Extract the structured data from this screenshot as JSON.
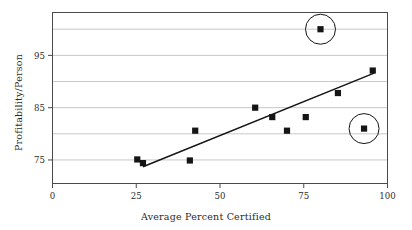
{
  "chart_data": {
    "type": "scatter",
    "title": "",
    "xlabel": "Average Percent Certified",
    "ylabel": "Profitability/Person",
    "xlim": [
      0,
      100
    ],
    "ylim": [
      70.5,
      103.2
    ],
    "grid": true,
    "legend": "none",
    "xticks": [
      0,
      25,
      50,
      75,
      100
    ],
    "xtick_labels": [
      "0",
      "25",
      "50",
      "75",
      "100"
    ],
    "yticks": [
      75,
      85,
      95
    ],
    "ytick_labels": [
      "75",
      "85",
      "95"
    ],
    "ygridlines": [
      75,
      80,
      85,
      90,
      95,
      100
    ],
    "points": [
      {
        "x": 25.3,
        "y": 75.1,
        "circled": false
      },
      {
        "x": 27.0,
        "y": 74.4,
        "circled": false
      },
      {
        "x": 41.0,
        "y": 74.9,
        "circled": false
      },
      {
        "x": 42.6,
        "y": 80.6,
        "circled": false
      },
      {
        "x": 60.5,
        "y": 85.0,
        "circled": false
      },
      {
        "x": 65.6,
        "y": 83.2,
        "circled": false
      },
      {
        "x": 70.0,
        "y": 80.6,
        "circled": false
      },
      {
        "x": 75.6,
        "y": 83.2,
        "circled": false
      },
      {
        "x": 80.0,
        "y": 100.0,
        "circled": true
      },
      {
        "x": 85.2,
        "y": 87.8,
        "circled": false
      },
      {
        "x": 93.0,
        "y": 81.0,
        "circled": true
      },
      {
        "x": 95.6,
        "y": 92.1,
        "circled": false
      }
    ],
    "trendline": {
      "label": "linear-fit",
      "x0": 27.0,
      "y0": 73.7,
      "x1": 96.0,
      "y1": 91.6
    },
    "annotations": [
      {
        "name": "outlier-circle-high",
        "x": 80.0,
        "y": 100.0,
        "radius_px": 15
      },
      {
        "name": "outlier-circle-low",
        "x": 93.0,
        "y": 81.0,
        "radius_px": 15
      }
    ],
    "colors": {
      "marker": "#151515",
      "trendline": "#151515",
      "gridline": "#b9b9b9",
      "frame": "#4a4a4a",
      "text": "#2b2b2b",
      "background": "#ffffff"
    }
  }
}
